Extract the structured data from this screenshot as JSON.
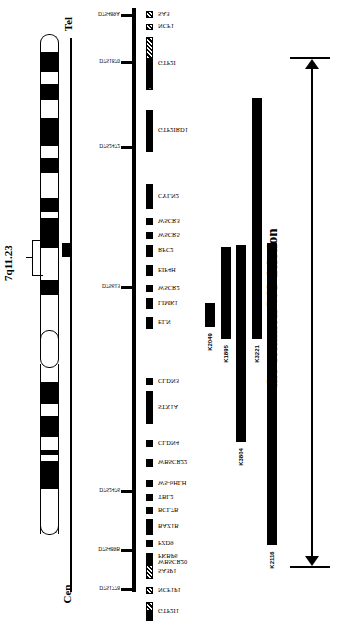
{
  "ideogram": {
    "band_label": "7q11.23",
    "ends": {
      "top": "Tel",
      "bottom": "Cen"
    },
    "bands": [
      {
        "y": 52,
        "h": 20,
        "c": "#000"
      },
      {
        "y": 72,
        "h": 12,
        "c": "#fff"
      },
      {
        "y": 84,
        "h": 16,
        "c": "#000"
      },
      {
        "y": 100,
        "h": 18,
        "c": "#fff"
      },
      {
        "y": 118,
        "h": 28,
        "c": "#000"
      },
      {
        "y": 146,
        "h": 12,
        "c": "#fff"
      },
      {
        "y": 158,
        "h": 15,
        "c": "#000"
      },
      {
        "y": 173,
        "h": 25,
        "c": "#fff"
      },
      {
        "y": 198,
        "h": 14,
        "c": "#000"
      },
      {
        "y": 212,
        "h": 6,
        "c": "#fff"
      },
      {
        "y": 218,
        "h": 30,
        "c": "#000"
      },
      {
        "y": 248,
        "h": 32,
        "c": "#fff"
      },
      {
        "y": 280,
        "h": 15,
        "c": "#000"
      },
      {
        "y": 295,
        "h": 12,
        "c": "#fff"
      },
      {
        "y": 307,
        "h": 12,
        "c": "#fff"
      },
      {
        "y": 368,
        "h": 14,
        "c": "#fff"
      },
      {
        "y": 382,
        "h": 22,
        "c": "#000"
      },
      {
        "y": 404,
        "h": 12,
        "c": "#fff"
      },
      {
        "y": 416,
        "h": 21,
        "c": "#000"
      },
      {
        "y": 437,
        "h": 13,
        "c": "#fff"
      },
      {
        "y": 450,
        "h": 5,
        "c": "#000"
      },
      {
        "y": 455,
        "h": 6,
        "c": "#fff"
      },
      {
        "y": 461,
        "h": 28,
        "c": "#000"
      }
    ]
  },
  "markers": [
    {
      "name": "D7S489A",
      "y": 14
    },
    {
      "name": "D7S1870",
      "y": 61
    },
    {
      "name": "D7S2472",
      "y": 146
    },
    {
      "name": "D7S613",
      "y": 286
    },
    {
      "name": "D7S2476",
      "y": 490
    },
    {
      "name": "D7S489B",
      "y": 549
    },
    {
      "name": "D7S1778",
      "y": 588
    }
  ],
  "genes": [
    {
      "name": "SA3",
      "y": 11,
      "h": 7,
      "style": "hatch"
    },
    {
      "name": "NCF1",
      "y": 24,
      "h": 6,
      "style": "hatch"
    },
    {
      "name": "GTF2I",
      "y": 37,
      "h": 53,
      "style": "partial-hatch"
    },
    {
      "name": "GTF2IRD1",
      "y": 110,
      "h": 42,
      "style": "solid"
    },
    {
      "name": "CYLN2",
      "y": 184,
      "h": 25,
      "style": "solid"
    },
    {
      "name": "WSCR3",
      "y": 218,
      "h": 7,
      "style": "solid"
    },
    {
      "name": "WSCR5",
      "y": 232,
      "h": 7,
      "style": "solid"
    },
    {
      "name": "RFC2",
      "y": 245,
      "h": 12,
      "style": "solid"
    },
    {
      "name": "EIF4H",
      "y": 265,
      "h": 11,
      "style": "solid"
    },
    {
      "name": "WSCR2",
      "y": 285,
      "h": 7,
      "style": "solid"
    },
    {
      "name": "LIMK1",
      "y": 298,
      "h": 11,
      "style": "solid"
    },
    {
      "name": "ELN",
      "y": 317,
      "h": 12,
      "style": "solid"
    },
    {
      "name": "CLDN3",
      "y": 378,
      "h": 7,
      "style": "solid"
    },
    {
      "name": "STX1A",
      "y": 391,
      "h": 33,
      "style": "solid"
    },
    {
      "name": "CLDN4",
      "y": 440,
      "h": 7,
      "style": "solid"
    },
    {
      "name": "WBSCR22",
      "y": 459,
      "h": 8,
      "style": "solid"
    },
    {
      "name": "WS-bHLH",
      "y": 480,
      "h": 7,
      "style": "solid"
    },
    {
      "name": "TBL2",
      "y": 494,
      "h": 7,
      "style": "solid"
    },
    {
      "name": "BCL7B",
      "y": 507,
      "h": 7,
      "style": "solid"
    },
    {
      "name": "BAZ1B",
      "y": 519,
      "h": 16,
      "style": "solid"
    },
    {
      "name": "FZD9",
      "y": 540,
      "h": 7,
      "style": "solid"
    },
    {
      "name": "FKBP6",
      "y": 553,
      "h": 7,
      "style": "solid"
    },
    {
      "name": "WBSCR20",
      "y": 560,
      "h": 5,
      "style": "solid"
    },
    {
      "name": "SA3P1",
      "y": 565,
      "h": 14,
      "style": "hatch"
    },
    {
      "name": "NCF1P1",
      "y": 587,
      "h": 7,
      "style": "hatch"
    },
    {
      "name": "GTF2I1",
      "y": 602,
      "h": 19,
      "style": "partial-hatch"
    }
  ],
  "deletions": [
    {
      "name": "K2049",
      "x": 205,
      "y": 303,
      "h": 24
    },
    {
      "name": "K1895",
      "x": 221,
      "y": 247,
      "h": 92
    },
    {
      "name": "K3804",
      "x": 236,
      "y": 245,
      "h": 197
    },
    {
      "name": "K3221",
      "x": 252,
      "y": 98,
      "h": 241
    },
    {
      "name": "K2116",
      "x": 267,
      "y": 243,
      "h": 302
    }
  ],
  "annotation": {
    "label": "the common WS deletion",
    "top_y": 58,
    "bottom_y": 567
  }
}
